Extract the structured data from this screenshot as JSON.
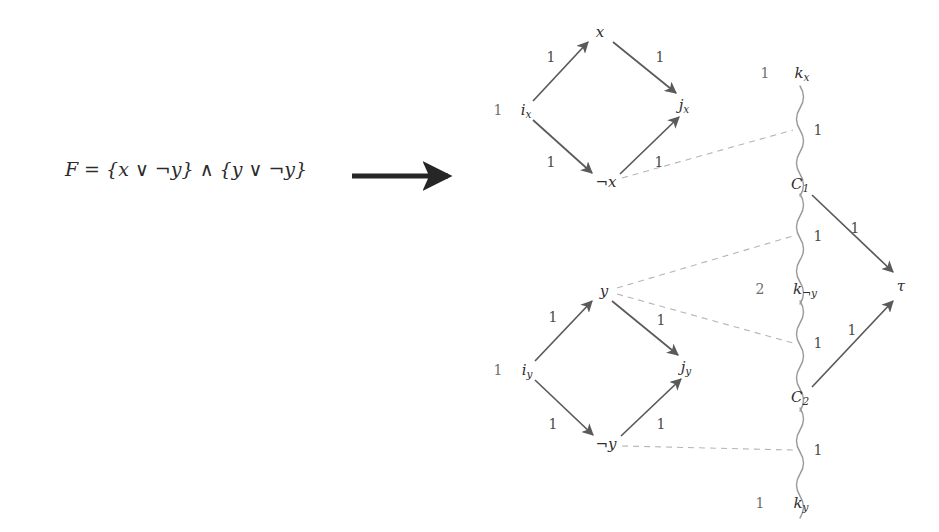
{
  "figure": {
    "background_color": "#ffffff",
    "formula": {
      "text": "F = {x ∨ ¬y} ∧ {y ∨ ¬y}",
      "lhs": "F",
      "equals": "=",
      "clause1_open": "{",
      "clause1_lit1": "x",
      "clause1_or": "∨",
      "clause1_lit2": "¬y",
      "clause1_close": "}",
      "and": "∧",
      "clause2_open": "{",
      "clause2_lit1": "y",
      "clause2_or": "∨",
      "clause2_lit2": "¬y",
      "clause2_close": "}"
    },
    "transform_arrow": {
      "name": "reduction-arrow",
      "color": "#262626"
    },
    "colors": {
      "solid_edge": "#5a5a5a",
      "wavy_edge": "#9a9a9a",
      "dashed_edge": "#b5b5b5",
      "node_text": "#2f2f2f",
      "weight_text": "#4a4a4a",
      "supply_text": "#6e6e6e"
    },
    "nodes": [
      {
        "id": "x",
        "label": "x",
        "sub": "",
        "neg": false,
        "x": 600,
        "y": 32,
        "supply": ""
      },
      {
        "id": "i_x",
        "label": "i",
        "sub": "x",
        "neg": false,
        "x": 526,
        "y": 110,
        "supply": "1"
      },
      {
        "id": "j_x",
        "label": "j",
        "sub": "x",
        "neg": false,
        "x": 684,
        "y": 105,
        "supply": ""
      },
      {
        "id": "notx",
        "label": "x",
        "sub": "",
        "neg": true,
        "x": 606,
        "y": 182,
        "supply": ""
      },
      {
        "id": "y",
        "label": "y",
        "sub": "",
        "neg": false,
        "x": 604,
        "y": 291,
        "supply": ""
      },
      {
        "id": "i_y",
        "label": "i",
        "sub": "y",
        "neg": false,
        "x": 527,
        "y": 370,
        "supply": "1"
      },
      {
        "id": "j_y",
        "label": "j",
        "sub": "y",
        "neg": false,
        "x": 686,
        "y": 367,
        "supply": ""
      },
      {
        "id": "noty",
        "label": "y",
        "sub": "",
        "neg": true,
        "x": 606,
        "y": 444,
        "supply": ""
      },
      {
        "id": "k_x",
        "label": "k",
        "sub": "x",
        "neg": false,
        "x": 802,
        "y": 73,
        "supply": "1"
      },
      {
        "id": "C_1",
        "label": "C",
        "sub": "1",
        "neg": false,
        "x": 800,
        "y": 184,
        "supply": ""
      },
      {
        "id": "k_noty",
        "label": "k",
        "sub": "¬y",
        "neg": false,
        "x": 805,
        "y": 289,
        "supply": "2"
      },
      {
        "id": "C_2",
        "label": "C",
        "sub": "2",
        "neg": false,
        "x": 800,
        "y": 397,
        "supply": ""
      },
      {
        "id": "k_y",
        "label": "k",
        "sub": "y",
        "neg": false,
        "x": 801,
        "y": 503,
        "supply": "1"
      },
      {
        "id": "tau",
        "label": "τ",
        "sub": "",
        "neg": false,
        "x": 901,
        "y": 286,
        "supply": ""
      }
    ],
    "solid_edges": [
      {
        "id": "ix-x",
        "from": "i_x",
        "to": "x",
        "weight": "1",
        "wx": 551,
        "wy": 57
      },
      {
        "id": "x-jx",
        "from": "x",
        "to": "j_x",
        "weight": "1",
        "wx": 660,
        "wy": 57
      },
      {
        "id": "ix-notx",
        "from": "i_x",
        "to": "notx",
        "weight": "1",
        "wx": 551,
        "wy": 162
      },
      {
        "id": "notx-jx",
        "from": "notx",
        "to": "j_x",
        "weight": "1",
        "wx": 659,
        "wy": 162
      },
      {
        "id": "iy-y",
        "from": "i_y",
        "to": "y",
        "weight": "1",
        "wx": 553,
        "wy": 317
      },
      {
        "id": "y-jy",
        "from": "y",
        "to": "j_y",
        "weight": "1",
        "wx": 661,
        "wy": 320
      },
      {
        "id": "iy-noty",
        "from": "i_y",
        "to": "noty",
        "weight": "1",
        "wx": 553,
        "wy": 424
      },
      {
        "id": "noty-jy",
        "from": "noty",
        "to": "j_y",
        "weight": "1",
        "wx": 661,
        "wy": 424
      },
      {
        "id": "C1-tau",
        "from": "C_1",
        "to": "tau",
        "weight": "1",
        "wx": 855,
        "wy": 228
      },
      {
        "id": "C2-tau",
        "from": "C_2",
        "to": "tau",
        "weight": "1",
        "wx": 852,
        "wy": 330
      }
    ],
    "wavy_edges": [
      {
        "id": "kx-C1",
        "from": "k_x",
        "to": "C_1",
        "weight": "1",
        "wx": 818,
        "wy": 130
      },
      {
        "id": "C1-knoty",
        "from": "C_1",
        "to": "k_noty",
        "weight": "1",
        "wx": 818,
        "wy": 236
      },
      {
        "id": "knoty-C2",
        "from": "k_noty",
        "to": "C_2",
        "weight": "1",
        "wx": 818,
        "wy": 343
      },
      {
        "id": "C2-ky",
        "from": "C_2",
        "to": "k_y",
        "weight": "1",
        "wx": 818,
        "wy": 450
      }
    ],
    "dashed_edges": [
      {
        "id": "notx-kxC1",
        "from": "notx",
        "to_edge": "kx-C1"
      },
      {
        "id": "y-C1knoty",
        "from": "y",
        "to_edge": "C1-knoty"
      },
      {
        "id": "y-knotyC2",
        "from": "y",
        "to_edge": "knoty-C2"
      },
      {
        "id": "noty-C2ky",
        "from": "noty",
        "to_edge": "C2-ky"
      }
    ]
  }
}
